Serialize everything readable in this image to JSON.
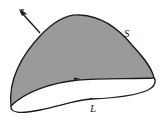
{
  "diagram": {
    "surface_label": "S",
    "boundary_label": "L",
    "normal_label": "e",
    "normal_subscript": "n",
    "colors": {
      "surface_fill": "#9a9a9a",
      "outline": "#1a1a1a",
      "background": "#ffffff"
    }
  }
}
